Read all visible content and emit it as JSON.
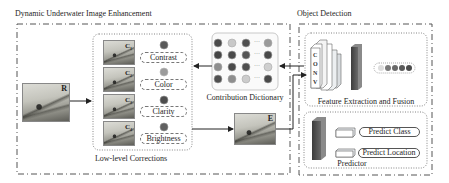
{
  "sections": {
    "enhancement": {
      "title": "Dynamic Underwater Image Enhancement"
    },
    "detection": {
      "title": "Object Detection"
    }
  },
  "input_image": {
    "label": "R"
  },
  "low_level": {
    "title": "Low-level Corrections",
    "items": [
      {
        "image_label": "C",
        "image_index": "1",
        "name": "Contrast",
        "dot_color": "#5a5a5a"
      },
      {
        "image_label": "C",
        "image_index": "2",
        "name": "Color",
        "dot_color": "#9c9c9c"
      },
      {
        "image_label": "C",
        "image_index": "3",
        "name": "Clarity",
        "dot_color": "#4e4e4e"
      },
      {
        "image_label": "C",
        "image_index": "4",
        "name": "Brightness",
        "dot_color": "#606060"
      }
    ]
  },
  "dictionary": {
    "title": "Contribution Dictionary",
    "ellipsis": "···",
    "grid": [
      [
        "#4a4a4a",
        "#c8c8c8",
        "#505050",
        "#9a9a9a"
      ],
      [
        "#454545",
        "#4a4a4a",
        "#555555",
        "#4a4a4a"
      ],
      [
        "#8e8e8e",
        "#4a4a4a",
        "#4e4e4e",
        "#cfcfcf"
      ],
      [
        "#505050",
        "#8e8e8e",
        "#cccccc",
        "#4a4a4a"
      ]
    ]
  },
  "output_image": {
    "label": "E"
  },
  "feature": {
    "title": "Feature Extraction and Fusion",
    "conv_label": [
      "C",
      "O",
      "N",
      "V"
    ],
    "vector_dots": [
      "#dedede",
      "#7a7a7a",
      "#6a6a6a",
      "#5a5a5a",
      "#4c4c4c"
    ]
  },
  "predictor": {
    "title": "Predictor",
    "outputs": [
      "Predict Class",
      "Predict Location"
    ]
  },
  "colors": {
    "line": "#222222",
    "dashed_border": "#555555",
    "dotted_border": "#666666",
    "feature_map": "#555555"
  }
}
